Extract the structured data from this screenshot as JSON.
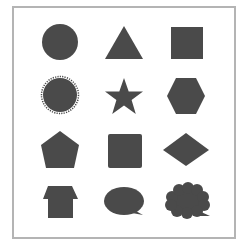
{
  "palette": {
    "shape_fill": "#4a4a4a",
    "frame_border": "#b4b4b4",
    "background": "#ffffff"
  },
  "grid": {
    "rows": 4,
    "columns": 3,
    "shapes": [
      {
        "row": 1,
        "col": 1,
        "name": "circle"
      },
      {
        "row": 1,
        "col": 2,
        "name": "triangle"
      },
      {
        "row": 1,
        "col": 3,
        "name": "square"
      },
      {
        "row": 2,
        "col": 1,
        "name": "sunburst"
      },
      {
        "row": 2,
        "col": 2,
        "name": "star"
      },
      {
        "row": 2,
        "col": 3,
        "name": "hexagon"
      },
      {
        "row": 3,
        "col": 1,
        "name": "pentagon"
      },
      {
        "row": 3,
        "col": 2,
        "name": "rounded-square"
      },
      {
        "row": 3,
        "col": 3,
        "name": "diamond"
      },
      {
        "row": 4,
        "col": 1,
        "name": "up-arrow-house"
      },
      {
        "row": 4,
        "col": 2,
        "name": "speech-bubble"
      },
      {
        "row": 4,
        "col": 3,
        "name": "thought-cloud"
      }
    ]
  }
}
